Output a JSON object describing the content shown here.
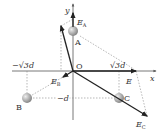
{
  "labels": {
    "y_axis": "y",
    "x_axis": "x",
    "origin": "O",
    "charge_a": "A",
    "charge_b": "B",
    "charge_c": "C",
    "field_a": "E",
    "field_a_sub": "A",
    "field_b": "E",
    "field_b_sub": "B",
    "field_c": "E",
    "field_c_sub": "C",
    "field_total": "E",
    "neg_sqrt3d": "−√3d",
    "pos_sqrt3d": "√3d",
    "neg_d": "−d"
  },
  "colors": {
    "axis": "#444444",
    "arrow": "#222222",
    "dashed": "#888888",
    "ball": "#aaaaaa"
  }
}
